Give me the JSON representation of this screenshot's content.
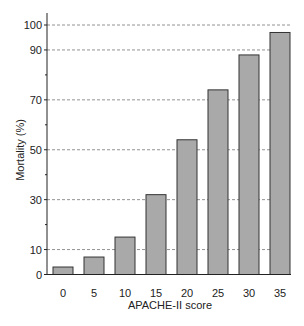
{
  "chart_data": {
    "type": "bar",
    "title": "",
    "xlabel": "APACHE-II score",
    "ylabel": "Mortality (%)",
    "categories": [
      "0",
      "5",
      "10",
      "15",
      "20",
      "25",
      "30",
      "35"
    ],
    "values": [
      3,
      7,
      15,
      32,
      54,
      74,
      88,
      97
    ],
    "ylim": [
      0,
      100
    ],
    "yticks_labeled": [
      0,
      10,
      30,
      50,
      70,
      90,
      100
    ],
    "yticks_minor": [
      20,
      40,
      60,
      80
    ],
    "gridlines": [
      10,
      30,
      50,
      70,
      90,
      100
    ],
    "grid": true,
    "legend": null,
    "colors": {
      "bar_fill": "#a9a9a9",
      "bar_stroke": "#333333",
      "grid": "#777777"
    }
  }
}
